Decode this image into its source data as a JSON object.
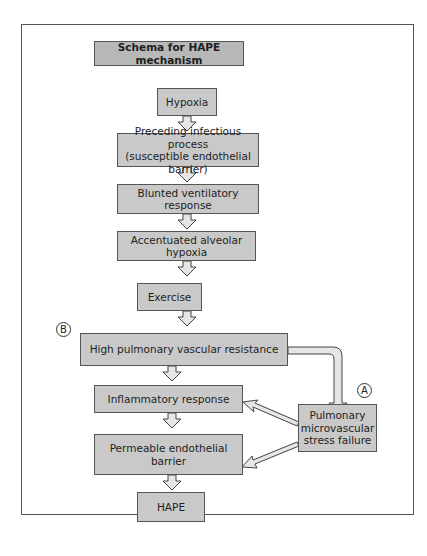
{
  "diagram": {
    "title": "Schema for HAPE mechanism",
    "nodes": {
      "hypoxia": "Hypoxia",
      "infectious_line1": "Preceding infectious process",
      "infectious_line2": "(susceptible endothelial barrier)",
      "blunted": "Blunted ventilatory response",
      "accentuated": "Accentuated alveolar hypoxia",
      "exercise": "Exercise",
      "high_pvr": "High pulmonary vascular resistance",
      "inflammatory": "Inflammatory response",
      "permeable_line1": "Permeable endothelial",
      "permeable_line2": "barrier",
      "hape": "HAPE",
      "stress_line1": "Pulmonary",
      "stress_line2": "microvascular",
      "stress_line3": "stress failure"
    },
    "markers": {
      "a": "A",
      "b": "B"
    },
    "colors": {
      "box_fill": "#c9c9c9",
      "title_fill": "#b8b8b8",
      "border": "#555555"
    }
  }
}
